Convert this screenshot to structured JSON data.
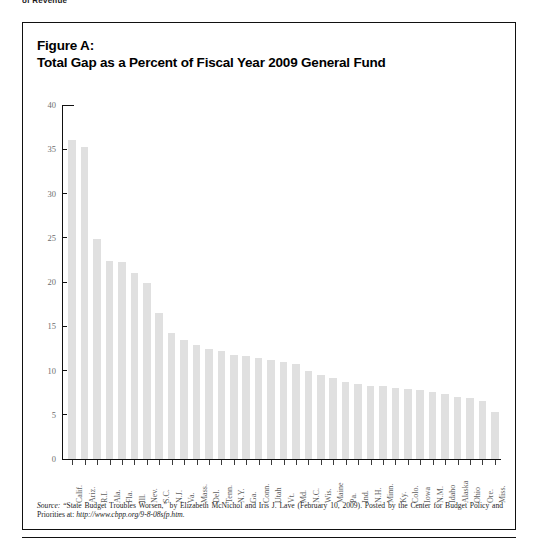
{
  "running_head": "of Revenue",
  "figure": {
    "title_line1": "Figure A:",
    "title_line2": "Total Gap as a Percent of Fiscal Year 2009 General Fund",
    "source_prefix": "Source:",
    "source_body": " “State Budget Troubles Worsen,” by Elizabeth McNichol and Iris J. Lave (February 10, 2009). Posted by the Center for Budget Policy and Priorities at: ",
    "source_url": "http://www.cbpp.org/9-8-08sfp.htm."
  },
  "chart_data": {
    "type": "bar",
    "title": "Total Gap as a Percent of Fiscal Year 2009 General Fund",
    "xlabel": "",
    "ylabel": "",
    "ylim": [
      0,
      40
    ],
    "yticks": [
      0,
      5,
      10,
      15,
      20,
      25,
      30,
      35,
      40
    ],
    "grid": false,
    "legend": "none",
    "bar_color": "#e0e0e0",
    "categories": [
      "Calif.",
      "Ariz.",
      "R.I.",
      "Ala.",
      "Fla.",
      "Ill.",
      "Nev.",
      "S.C.",
      "N.J.",
      "Va.",
      "Mass.",
      "Del.",
      "Tenn.",
      "N.Y.",
      "Ga.",
      "Conn.",
      "Utah",
      "Vt.",
      "Md.",
      "N.C.",
      "Wis.",
      "Maine",
      "Pa.",
      "Ind.",
      "N.H.",
      "Minn.",
      "Ky.",
      "Colo.",
      "Iowa",
      "N.M.",
      "Idaho",
      "Alaska",
      "Ohio",
      "Ore.",
      "Miss."
    ],
    "values": [
      36.0,
      35.2,
      24.9,
      22.4,
      22.3,
      21.0,
      19.9,
      16.5,
      14.2,
      13.5,
      12.9,
      12.4,
      12.2,
      11.8,
      11.6,
      11.4,
      11.2,
      11.0,
      10.7,
      10.0,
      9.5,
      9.2,
      8.7,
      8.5,
      8.3,
      8.2,
      8.0,
      7.9,
      7.8,
      7.6,
      7.3,
      7.0,
      6.9,
      6.6,
      5.3
    ]
  }
}
